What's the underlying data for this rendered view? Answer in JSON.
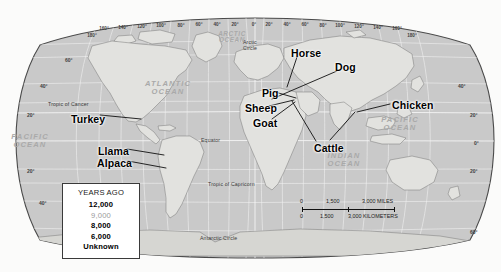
{
  "map": {
    "title": "World map of animal domestication origins",
    "projection": "Robinson",
    "oceans": [
      {
        "name": "arctic-ocean",
        "line1": "ARCTIC",
        "line2": "OCEAN",
        "x": 232,
        "y": 31
      },
      {
        "name": "atlantic-ocean",
        "line1": "ATLANTIC",
        "line2": "OCEAN",
        "x": 168,
        "y": 80
      },
      {
        "name": "pacific-ocean-west",
        "line1": "PACIFIC",
        "line2": "OCEAN",
        "x": 30,
        "y": 133
      },
      {
        "name": "pacific-ocean-east",
        "line1": "PACIFIC",
        "line2": "OCEAN",
        "x": 400,
        "y": 116
      },
      {
        "name": "indian-ocean",
        "line1": "INDIAN",
        "line2": "OCEAN",
        "x": 344,
        "y": 152
      }
    ],
    "reference_lines": [
      {
        "name": "arctic-circle",
        "label": "Arctic Circle",
        "x": 243,
        "y": 40
      },
      {
        "name": "tropic-of-cancer",
        "label": "Tropic of Cancer",
        "x": 48,
        "y": 102
      },
      {
        "name": "equator",
        "label": "Equator",
        "x": 201,
        "y": 138
      },
      {
        "name": "tropic-of-capricorn",
        "label": "Tropic of Capricorn",
        "x": 208,
        "y": 182
      },
      {
        "name": "antarctic-circle",
        "label": "Antarctic Circle",
        "x": 200,
        "y": 236
      }
    ],
    "longitude_labels": [
      {
        "label": "180°",
        "x": 92,
        "y": 34
      },
      {
        "label": "160°",
        "x": 104,
        "y": 27
      },
      {
        "label": "140°",
        "x": 123,
        "y": 26
      },
      {
        "label": "120°",
        "x": 142,
        "y": 25
      },
      {
        "label": "100°",
        "x": 161,
        "y": 24
      },
      {
        "label": "80°",
        "x": 181,
        "y": 24
      },
      {
        "label": "60°",
        "x": 199,
        "y": 23
      },
      {
        "label": "40°",
        "x": 217,
        "y": 23
      },
      {
        "label": "20°",
        "x": 235,
        "y": 23
      },
      {
        "label": "0°",
        "x": 254,
        "y": 23
      },
      {
        "label": "20°",
        "x": 269,
        "y": 23
      },
      {
        "label": "40°",
        "x": 287,
        "y": 23
      },
      {
        "label": "60°",
        "x": 305,
        "y": 23
      },
      {
        "label": "80°",
        "x": 323,
        "y": 24
      },
      {
        "label": "100°",
        "x": 340,
        "y": 24
      },
      {
        "label": "120°",
        "x": 359,
        "y": 25
      },
      {
        "label": "140°",
        "x": 378,
        "y": 26
      },
      {
        "label": "160°",
        "x": 397,
        "y": 27
      },
      {
        "label": "180°",
        "x": 412,
        "y": 34
      }
    ],
    "latitude_labels": [
      {
        "label": "60°",
        "x": 65,
        "y": 58
      },
      {
        "label": "40°",
        "x": 40,
        "y": 84
      },
      {
        "label": "20°",
        "x": 27,
        "y": 113
      },
      {
        "label": "20°",
        "x": 27,
        "y": 169
      },
      {
        "label": "40°",
        "x": 39,
        "y": 201
      },
      {
        "label": "60°",
        "x": 470,
        "y": 230
      },
      {
        "label": "40°",
        "x": 458,
        "y": 84
      },
      {
        "label": "20°",
        "x": 470,
        "y": 113
      },
      {
        "label": "0°",
        "x": 474,
        "y": 141
      },
      {
        "label": "20°",
        "x": 470,
        "y": 169
      }
    ],
    "animals": [
      {
        "name": "turkey",
        "label": "Turkey",
        "x": 71,
        "y": 114,
        "anchor_x": 140,
        "anchor_y": 119
      },
      {
        "name": "llama",
        "label": "Llama",
        "x": 98,
        "y": 146,
        "anchor_x": 160,
        "anchor_y": 155
      },
      {
        "name": "alpaca",
        "label": "Alpaca",
        "x": 97,
        "y": 158,
        "anchor_x": 161,
        "anchor_y": 168
      },
      {
        "name": "horse",
        "label": "Horse",
        "x": 291,
        "y": 48,
        "anchor_x": 286,
        "anchor_y": 86
      },
      {
        "name": "dog",
        "label": "Dog",
        "x": 335,
        "y": 62,
        "anchor_x": 272,
        "anchor_y": 98
      },
      {
        "name": "pig",
        "label": "Pig",
        "x": 262,
        "y": 88,
        "anchor_x": 295,
        "anchor_y": 97
      },
      {
        "name": "sheep",
        "label": "Sheep",
        "x": 245,
        "y": 103,
        "anchor_x": 293,
        "anchor_y": 99
      },
      {
        "name": "goat",
        "label": "Goat",
        "x": 253,
        "y": 118,
        "anchor_x": 294,
        "anchor_y": 101
      },
      {
        "name": "chicken",
        "label": "Chicken",
        "x": 392,
        "y": 100,
        "anchor_x": 358,
        "anchor_y": 112
      },
      {
        "name": "cattle",
        "label": "Cattle",
        "x": 314,
        "y": 143,
        "anchor_x": 291,
        "anchor_y": 100
      }
    ]
  },
  "legend": {
    "title": "YEARS AGO",
    "entries": [
      {
        "label": "12,000",
        "style": "bold"
      },
      {
        "label": "9,000",
        "style": "faded"
      },
      {
        "label": "8,000",
        "style": "bold"
      },
      {
        "label": "6,000",
        "style": "bold"
      },
      {
        "label": "Unknown",
        "style": "bold"
      }
    ]
  },
  "scale": {
    "miles": {
      "zero": "0",
      "mid": "1,500",
      "max": "3,000 MILES"
    },
    "kilometers": {
      "zero": "0",
      "mid": "1,500",
      "max": "3,000 KILOMETERS"
    }
  }
}
